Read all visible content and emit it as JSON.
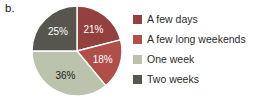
{
  "figure_label": "b.",
  "chart_data": {
    "type": "pie",
    "title": "",
    "legend_position": "right",
    "start_angle_deg": 0,
    "direction": "clockwise",
    "categories": [
      "A few days",
      "A few long weekends",
      "One week",
      "Two weeks"
    ],
    "values": [
      21,
      18,
      36,
      25
    ],
    "slices": [
      {
        "label": "A few days",
        "value": 21,
        "display": "21%",
        "color": "#94403e",
        "text_color": "#ffffff"
      },
      {
        "label": "A few long weekends",
        "value": 18,
        "display": "18%",
        "color": "#b04f4a",
        "text_color": "#ffffff"
      },
      {
        "label": "One week",
        "value": 36,
        "display": "36%",
        "color": "#bcc3ac",
        "text_color": "#1a1a1a"
      },
      {
        "label": "Two weeks",
        "value": 25,
        "display": "25%",
        "color": "#57564e",
        "text_color": "#ffffff"
      }
    ]
  }
}
